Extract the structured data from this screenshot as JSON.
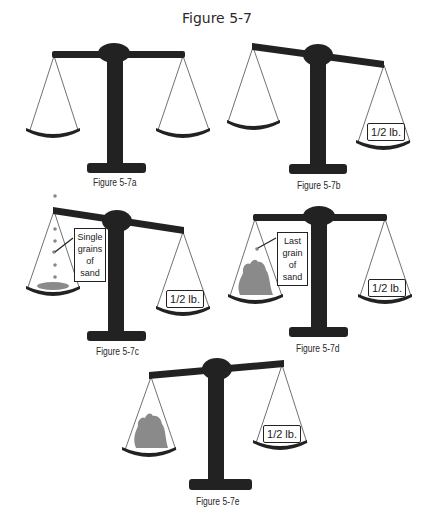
{
  "title": "Figure 5-7",
  "colors": {
    "scale": "#222222",
    "sand": "#8a8a8a",
    "text": "#2a2a2a"
  },
  "panels": [
    {
      "id": "a",
      "caption": "Figure 5-7a",
      "tilt": "level",
      "left_pan": "empty",
      "right_pan": "empty"
    },
    {
      "id": "b",
      "caption": "Figure 5-7b",
      "tilt": "right-down",
      "left_pan": "empty",
      "right_pan": "1/2 lb."
    },
    {
      "id": "c",
      "caption": "Figure 5-7c",
      "tilt": "right-down",
      "left_pan": "few grains of sand",
      "right_pan": "1/2 lb.",
      "annotation": "Single grains of sand"
    },
    {
      "id": "d",
      "caption": "Figure 5-7d",
      "tilt": "level",
      "left_pan": "pile of sand",
      "right_pan": "1/2 lb.",
      "annotation": "Last grain of sand"
    },
    {
      "id": "e",
      "caption": "Figure 5-7e",
      "tilt": "left-down",
      "left_pan": "pile of sand",
      "right_pan": "1/2 lb."
    }
  ],
  "labels": {
    "weight": "1/2 lb.",
    "note_c": [
      "Single",
      "grains of",
      "sand"
    ],
    "note_d": [
      "Last",
      "grain of",
      "sand"
    ]
  }
}
